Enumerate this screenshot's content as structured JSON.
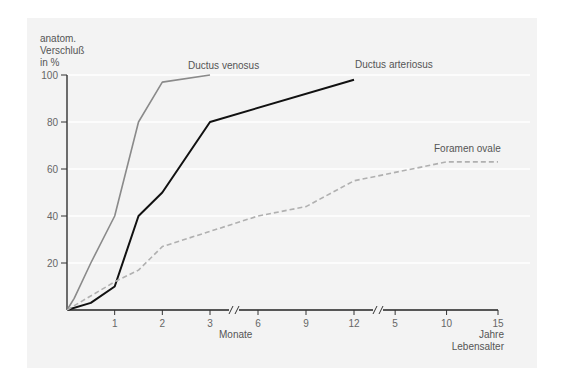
{
  "chart_data": {
    "type": "line",
    "title": "",
    "ylabel": [
      "anatom.",
      "Verschluß",
      "in %"
    ],
    "ylim": [
      0,
      100
    ],
    "yticks": [
      20,
      40,
      60,
      80,
      100
    ],
    "x_segments": [
      {
        "unit": "Monate",
        "ticks": [
          "1",
          "2",
          "3"
        ],
        "range": [
          0,
          3
        ]
      },
      {
        "unit": "Monate",
        "ticks": [
          "6",
          "9",
          "12"
        ],
        "range": [
          3,
          12
        ]
      },
      {
        "unit": "Jahre",
        "ticks": [
          "5",
          "10",
          "15"
        ],
        "range": [
          1,
          15
        ]
      }
    ],
    "xlabel_months": "Monate",
    "xlabel_years": [
      "Jahre",
      "Lebensalter"
    ],
    "grid": true,
    "series": [
      {
        "name": "Ductus venosus",
        "style": "solid",
        "color": "#8a8a8a",
        "points": [
          {
            "seg": 0,
            "x": 0,
            "y": 0
          },
          {
            "seg": 0,
            "x": 0.15,
            "y": 5
          },
          {
            "seg": 0,
            "x": 0.5,
            "y": 20
          },
          {
            "seg": 0,
            "x": 1,
            "y": 40
          },
          {
            "seg": 0,
            "x": 1.5,
            "y": 80
          },
          {
            "seg": 0,
            "x": 2,
            "y": 97
          },
          {
            "seg": 0,
            "x": 3,
            "y": 100
          }
        ]
      },
      {
        "name": "Ductus arteriosus",
        "style": "solid",
        "color": "#111111",
        "points": [
          {
            "seg": 0,
            "x": 0,
            "y": 0
          },
          {
            "seg": 0,
            "x": 0.5,
            "y": 3
          },
          {
            "seg": 0,
            "x": 1,
            "y": 10
          },
          {
            "seg": 0,
            "x": 1.5,
            "y": 40
          },
          {
            "seg": 0,
            "x": 2,
            "y": 50
          },
          {
            "seg": 0,
            "x": 3,
            "y": 80
          },
          {
            "seg": 1,
            "x": 12,
            "y": 98
          }
        ]
      },
      {
        "name": "Foramen ovale",
        "style": "dashed",
        "color": "#b0b0b0",
        "points": [
          {
            "seg": 0,
            "x": 0,
            "y": 0
          },
          {
            "seg": 0,
            "x": 1,
            "y": 12
          },
          {
            "seg": 0,
            "x": 1.5,
            "y": 17
          },
          {
            "seg": 0,
            "x": 2,
            "y": 27
          },
          {
            "seg": 1,
            "x": 6,
            "y": 40
          },
          {
            "seg": 1,
            "x": 9,
            "y": 44
          },
          {
            "seg": 1,
            "x": 12,
            "y": 55
          },
          {
            "seg": 2,
            "x": 10,
            "y": 63
          },
          {
            "seg": 2,
            "x": 15,
            "y": 63
          }
        ]
      }
    ]
  }
}
